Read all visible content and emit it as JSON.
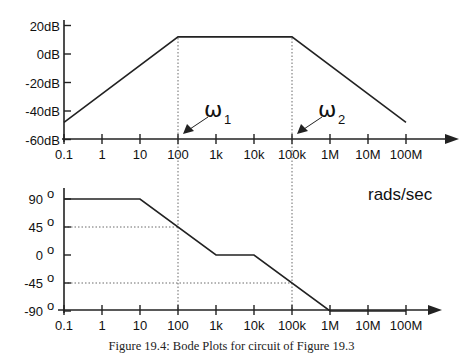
{
  "chart_data": [
    {
      "type": "line",
      "title": "Magnitude Bode plot",
      "xscale": "log",
      "xlabel": "rads/sec",
      "ylabel": "Magnitude (dB)",
      "x_ticks": [
        "0.1",
        "1",
        "10",
        "100",
        "1k",
        "10k",
        "100k",
        "1M",
        "10M",
        "100M"
      ],
      "y_ticks": [
        "20dB",
        "0dB",
        "-20dB",
        "-40dB",
        "-60dB"
      ],
      "ylim": [
        -60,
        20
      ],
      "series": [
        {
          "name": "|H(jw)| asymptote",
          "x": [
            0.1,
            100,
            100000,
            100000000
          ],
          "y": [
            -48,
            12,
            12,
            -48
          ]
        }
      ],
      "annotations": [
        {
          "label": "ω1",
          "sub": "1",
          "x": 100,
          "note": "arrow points to 100 on axis, dotted vertical line"
        },
        {
          "label": "ω2",
          "sub": "2",
          "x": 100000,
          "note": "arrow points to 100k on axis, dotted vertical line"
        }
      ],
      "grid": false
    },
    {
      "type": "line",
      "title": "Phase Bode plot",
      "xscale": "log",
      "xlabel": "rads/sec",
      "ylabel": "Phase (degrees)",
      "x_ticks": [
        "0.1",
        "1",
        "10",
        "100",
        "1k",
        "10k",
        "100k",
        "1M",
        "10M",
        "100M"
      ],
      "y_ticks": [
        "90 °",
        "45 °",
        "0 °",
        "-45 °",
        "-90 °"
      ],
      "ylim": [
        -90,
        90
      ],
      "series": [
        {
          "name": "phase asymptote",
          "x": [
            0.1,
            10,
            1000,
            10000,
            1000000,
            100000000
          ],
          "y": [
            90,
            90,
            0,
            0,
            -90,
            -90
          ]
        }
      ],
      "reference_lines": [
        {
          "type": "horizontal-dotted",
          "y": 45,
          "to_x": 100
        },
        {
          "type": "horizontal-dotted",
          "y": -45,
          "to_x": 100000
        },
        {
          "type": "vertical-dotted",
          "x": 100
        },
        {
          "type": "vertical-dotted",
          "x": 100000
        }
      ],
      "grid": false
    }
  ],
  "figure": {
    "units_label": "rads/sec",
    "omega1": {
      "symbol": "ω",
      "sub": "1"
    },
    "omega2": {
      "symbol": "ω",
      "sub": "2"
    },
    "caption": "Figure 19.4: Bode Plots for circuit of Figure 19.3"
  },
  "magnitude": {
    "y_ticks": [
      {
        "label": "20dB",
        "db": 20
      },
      {
        "label": "0dB",
        "db": 0
      },
      {
        "label": "-20dB",
        "db": -20
      },
      {
        "label": "-40dB",
        "db": -40
      },
      {
        "label": "-60dB",
        "db": -60
      }
    ],
    "x_ticks": [
      "0.1",
      "1",
      "10",
      "100",
      "1k",
      "10k",
      "100k",
      "1M",
      "10M",
      "100M"
    ]
  },
  "phase": {
    "y_ticks": [
      {
        "label": "90",
        "deg": 90
      },
      {
        "label": "45",
        "deg": 45
      },
      {
        "label": "0",
        "deg": 0
      },
      {
        "label": "-45",
        "deg": -45
      },
      {
        "label": "-90",
        "deg": -90
      }
    ],
    "degree_symbol": "o",
    "x_ticks": [
      "0.1",
      "1",
      "10",
      "100",
      "1k",
      "10k",
      "100k",
      "1M",
      "10M",
      "100M"
    ]
  }
}
